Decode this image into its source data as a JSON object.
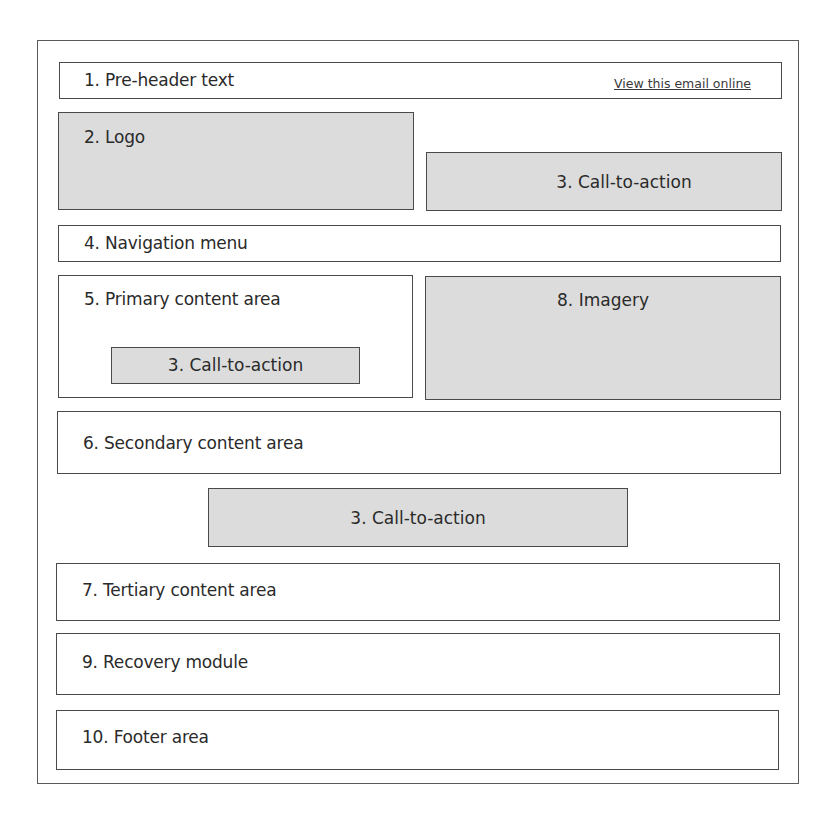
{
  "diagram": {
    "sections": {
      "preheader": {
        "label": "1. Pre-header text",
        "link": "View this email online"
      },
      "logo": {
        "label": "2. Logo"
      },
      "cta_header": {
        "label": "3. Call-to-action"
      },
      "navigation": {
        "label": "4. Navigation menu"
      },
      "primary": {
        "label": "5. Primary content area",
        "cta_label": "3. Call-to-action"
      },
      "imagery": {
        "label": "8. Imagery"
      },
      "secondary": {
        "label": "6. Secondary content area"
      },
      "cta_middle": {
        "label": "3. Call-to-action"
      },
      "tertiary": {
        "label": "7. Tertiary content area"
      },
      "recovery": {
        "label": "9. Recovery module"
      },
      "footer": {
        "label": "10. Footer area"
      }
    },
    "colors": {
      "border": "#4a4a4a",
      "placeholder_fill": "#dcdcdc",
      "background": "#ffffff"
    }
  }
}
